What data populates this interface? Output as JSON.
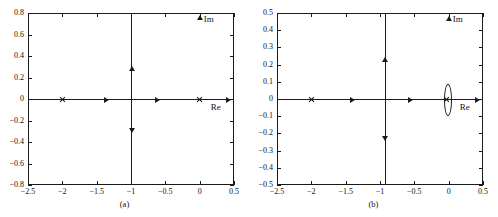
{
  "figure": {
    "panels": [
      {
        "id": "a",
        "caption": "(a)",
        "axis_labels": {
          "real": "Re",
          "imag": "Im"
        },
        "chart_data": {
          "type": "scatter",
          "title": "",
          "xlabel": "Re",
          "ylabel": "Im",
          "xlim": [
            -2.5,
            0.5
          ],
          "ylim": [
            -0.8,
            0.8
          ],
          "xticks": [
            "-2.5",
            "-2",
            "-1.5",
            "-1",
            "-0.5",
            "0",
            "0.5"
          ],
          "xtick_values": [
            -2.5,
            -2,
            -1.5,
            -1,
            -0.5,
            0,
            0.5
          ],
          "yticks": [
            "0.8",
            "0.6",
            "0.4",
            "0.2",
            "0",
            "-0.2",
            "-0.4",
            "-0.6",
            "-0.8"
          ],
          "ytick_values": [
            0.8,
            0.6,
            0.4,
            0.2,
            0,
            -0.2,
            -0.4,
            -0.6,
            -0.8
          ],
          "grid": false,
          "legend": "none",
          "poles": [
            {
              "re": -2.0,
              "im": 0.0
            },
            {
              "re": 0.0,
              "im": 0.0
            }
          ],
          "loci": [
            {
              "kind": "real-axis-segment",
              "from": [
                -2.5,
                0.0
              ],
              "to": [
                0.5,
                0.0
              ]
            },
            {
              "kind": "vertical-asymptote",
              "re": -1.0,
              "from_im": -0.8,
              "to_im": 0.8
            }
          ],
          "direction_arrows": [
            {
              "re": -1.35,
              "im": 0.0,
              "dir": "right"
            },
            {
              "re": -0.62,
              "im": 0.0,
              "dir": "right"
            },
            {
              "re": 0.42,
              "im": 0.0,
              "dir": "right"
            },
            {
              "re": -1.0,
              "im": 0.28,
              "dir": "up"
            },
            {
              "re": -1.0,
              "im": -0.29,
              "dir": "down"
            },
            {
              "re": 0.0,
              "im": 0.76,
              "dir": "up"
            }
          ]
        }
      },
      {
        "id": "b",
        "caption": "(b)",
        "axis_labels": {
          "real": "Re",
          "imag": "Im"
        },
        "chart_data": {
          "type": "scatter",
          "title": "",
          "xlabel": "Re",
          "ylabel": "Im",
          "xlim": [
            -2.5,
            0.5
          ],
          "ylim": [
            -0.5,
            0.5
          ],
          "xticks": [
            "-2.5",
            "-2",
            "-1.5",
            "-1",
            "-0.5",
            "0",
            "0.5"
          ],
          "xtick_values": [
            -2.5,
            -2,
            -1.5,
            -1,
            -0.5,
            0,
            0.5
          ],
          "yticks": [
            "0.5",
            "0.4",
            "0.3",
            "0.2",
            "0.1",
            "0",
            "-0.1",
            "-0.2",
            "-0.3",
            "-0.4",
            "-0.5"
          ],
          "ytick_values": [
            0.5,
            0.4,
            0.3,
            0.2,
            0.1,
            0,
            -0.1,
            -0.2,
            -0.3,
            -0.4,
            -0.5
          ],
          "grid": false,
          "legend": "none",
          "poles": [
            {
              "re": -2.0,
              "im": 0.0
            },
            {
              "re": -0.03,
              "im": 0.0
            }
          ],
          "loci": [
            {
              "kind": "real-axis-segment",
              "from": [
                -2.5,
                0.0
              ],
              "to": [
                0.5,
                0.0
              ]
            },
            {
              "kind": "vertical-asymptote",
              "re": -0.93,
              "from_im": -0.5,
              "to_im": 0.5
            },
            {
              "kind": "ellipse",
              "center_re": -0.03,
              "center_im": 0.0,
              "half_width_re": 0.045,
              "half_height_im": 0.085
            }
          ],
          "direction_arrows": [
            {
              "re": -1.4,
              "im": 0.0,
              "dir": "right"
            },
            {
              "re": -0.55,
              "im": 0.0,
              "dir": "right"
            },
            {
              "re": 0.42,
              "im": 0.0,
              "dir": "right"
            },
            {
              "re": -0.93,
              "im": 0.23,
              "dir": "up"
            },
            {
              "re": -0.93,
              "im": -0.23,
              "dir": "down"
            },
            {
              "re": 0.0,
              "im": 0.47,
              "dir": "up"
            }
          ]
        }
      }
    ]
  }
}
